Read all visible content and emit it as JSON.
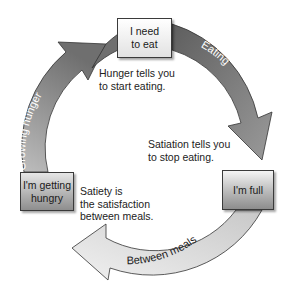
{
  "diagram": {
    "type": "cycle",
    "stages": [
      {
        "id": "need",
        "label": "I need to eat",
        "line1": "I need",
        "line2": "to eat"
      },
      {
        "id": "full",
        "label": "I'm full"
      },
      {
        "id": "hungry",
        "label": "I'm getting hungry",
        "line1": "I'm getting",
        "line2": "hungry"
      }
    ],
    "arcs": [
      {
        "label": "Eating",
        "from": "need",
        "to": "full",
        "color": "#7d7d7d"
      },
      {
        "label": "Between meals",
        "from": "full",
        "to": "hungry",
        "color": "#e0e0e0"
      },
      {
        "label": "Growing hunger",
        "from": "hungry",
        "to": "need",
        "color": "#9a9a9a"
      }
    ],
    "notes": {
      "hunger": {
        "line1": "Hunger tells you",
        "line2": "to start eating."
      },
      "satiation": {
        "line1": "Satiation tells you",
        "line2": "to stop eating."
      },
      "satiety": {
        "line1": "Satiety is",
        "line2": "the satisfaction",
        "line3": "between meals."
      }
    }
  }
}
